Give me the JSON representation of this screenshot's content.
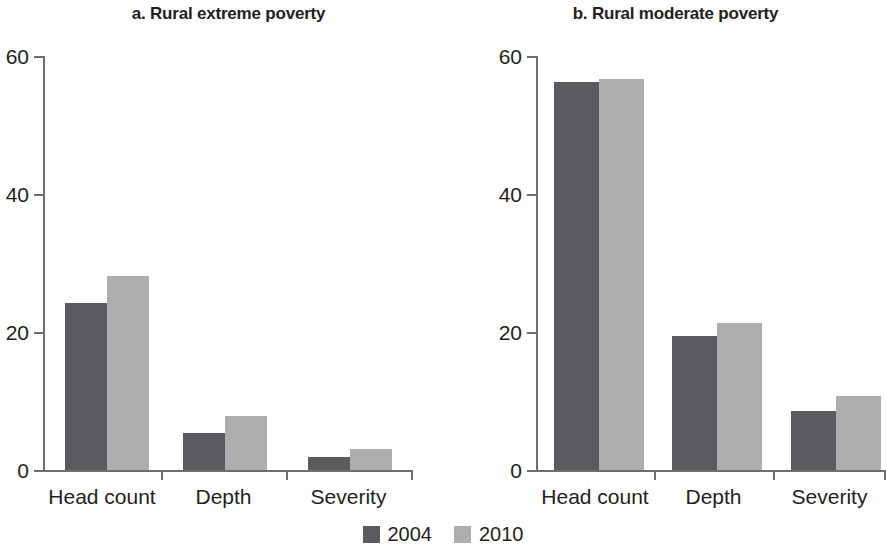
{
  "chart_data": [
    {
      "type": "bar",
      "panel": "a",
      "title": "a. Rural extreme poverty",
      "categories": [
        "Head count",
        "Depth",
        "Severity"
      ],
      "series": [
        {
          "name": "2004",
          "color": "#595b5f",
          "values": [
            24.2,
            5.4,
            1.9
          ]
        },
        {
          "name": "2010",
          "color": "#adaeb0",
          "values": [
            28.1,
            7.9,
            3.0
          ]
        }
      ],
      "xlabel": "",
      "ylabel": "",
      "ylim": [
        0,
        60
      ],
      "yticks": [
        0,
        20,
        40,
        60
      ],
      "grid": false,
      "legend_position": "bottom-center"
    },
    {
      "type": "bar",
      "panel": "b",
      "title": "b. Rural moderate poverty",
      "categories": [
        "Head count",
        "Depth",
        "Severity"
      ],
      "series": [
        {
          "name": "2004",
          "color": "#595b5f",
          "values": [
            56.2,
            19.4,
            8.6
          ]
        },
        {
          "name": "2010",
          "color": "#adaeb0",
          "values": [
            56.7,
            21.3,
            10.7
          ]
        }
      ],
      "xlabel": "",
      "ylabel": "",
      "ylim": [
        0,
        60
      ],
      "yticks": [
        0,
        20,
        40,
        60
      ],
      "grid": false,
      "legend_position": "bottom-center"
    }
  ],
  "panel_a": {
    "title": "a. Rural extreme poverty",
    "yticks": {
      "t0": "0",
      "t20": "20",
      "t40": "40",
      "t60": "60"
    },
    "categories": {
      "c0": "Head count",
      "c1": "Depth",
      "c2": "Severity"
    }
  },
  "panel_b": {
    "title": "b. Rural moderate poverty",
    "yticks": {
      "t0": "0",
      "t20": "20",
      "t40": "40",
      "t60": "60"
    },
    "categories": {
      "c0": "Head count",
      "c1": "Depth",
      "c2": "Severity"
    }
  },
  "legend": {
    "items": [
      {
        "label": "2004",
        "color": "#595b5f"
      },
      {
        "label": "2010",
        "color": "#adaeb0"
      }
    ]
  }
}
